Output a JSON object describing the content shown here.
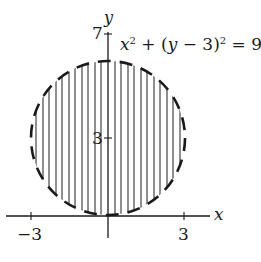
{
  "diagram": {
    "equation": {
      "x": "x",
      "sup1": "2",
      "mid": " + (",
      "y": "y",
      "rest": " − 3)",
      "sup2": "2",
      "end": " = 9"
    },
    "axes": {
      "x_label": "x",
      "y_label": "y"
    },
    "ticks": {
      "x_neg": "−3",
      "x_pos": "3",
      "y_mid": "3",
      "y_top": "7"
    },
    "region": {
      "shape": "circle",
      "center": [
        0,
        3
      ],
      "radius": 3,
      "boundary": "dashed",
      "fill": "vertical hatching"
    },
    "colors": {
      "ink": "#1a1a1a",
      "background": "#ffffff"
    }
  }
}
